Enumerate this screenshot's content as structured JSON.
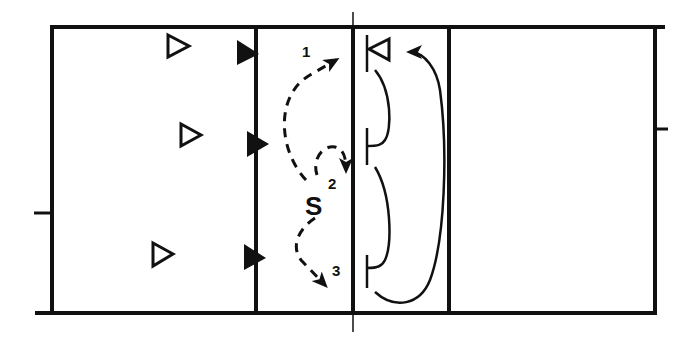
{
  "diagram": {
    "type": "volleyball-court-play",
    "colors": {
      "line": "#111111",
      "background": "#ffffff"
    },
    "labels": {
      "setter": "S",
      "route_1": "1",
      "route_2": "2",
      "route_3": "3"
    },
    "players": {
      "left_back_row": [
        {
          "shape": "open-triangle",
          "x": 178,
          "y": 47
        },
        {
          "shape": "open-triangle",
          "x": 187,
          "y": 134
        },
        {
          "shape": "open-triangle",
          "x": 160,
          "y": 254
        }
      ],
      "left_front_row": [
        {
          "shape": "filled-triangle",
          "x": 247,
          "y": 53
        },
        {
          "shape": "filled-triangle",
          "x": 256,
          "y": 144
        },
        {
          "shape": "filled-triangle",
          "x": 253,
          "y": 258
        }
      ],
      "opposing_blocker": {
        "shape": "open-triangle",
        "x": 378,
        "y": 49
      }
    },
    "routes": [
      {
        "name": "route-1",
        "style": "dashed",
        "label": "1"
      },
      {
        "name": "route-2",
        "style": "dashed",
        "label": "2"
      },
      {
        "name": "route-3",
        "style": "dashed",
        "label": "3"
      },
      {
        "name": "block-shift-1",
        "style": "solid"
      },
      {
        "name": "block-shift-2",
        "style": "solid"
      },
      {
        "name": "block-shift-3",
        "style": "solid"
      }
    ]
  }
}
